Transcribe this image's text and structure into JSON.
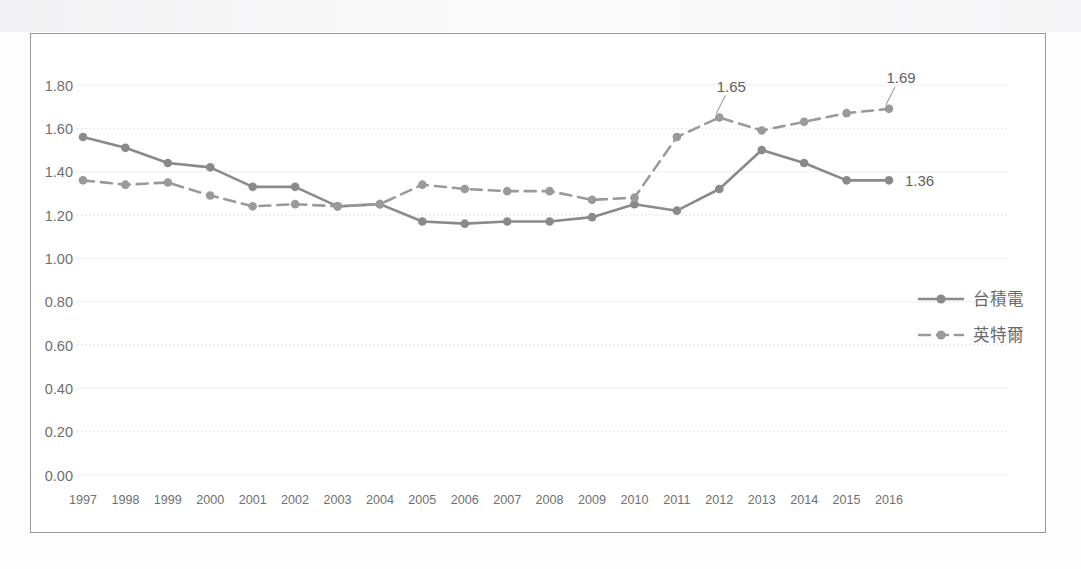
{
  "chart_data": {
    "type": "line",
    "title": "",
    "subtitle": "",
    "xlabel": "",
    "ylabel": "",
    "ylim": [
      0.0,
      1.8
    ],
    "ytick_step": 0.2,
    "ytick_labels": [
      "1.80",
      "1.60",
      "1.40",
      "1.20",
      "1.00",
      "0.80",
      "0.60",
      "0.40",
      "0.20",
      "0.00"
    ],
    "ytick_values": [
      1.8,
      1.6,
      1.4,
      1.2,
      1.0,
      0.8,
      0.6,
      0.4,
      0.2,
      0.0
    ],
    "grid": true,
    "grid_style": "horizontal-dotted",
    "legend_position": "right",
    "categories": [
      "1997",
      "1998",
      "1999",
      "2000",
      "2001",
      "2002",
      "2003",
      "2004",
      "2005",
      "2006",
      "2007",
      "2008",
      "2009",
      "2010",
      "2011",
      "2012",
      "2013",
      "2014",
      "2015",
      "2016"
    ],
    "series": [
      {
        "name": "台積電",
        "style": "solid",
        "color": "#8a8a8a",
        "marker": "circle",
        "values": [
          1.56,
          1.51,
          1.44,
          1.42,
          1.33,
          1.33,
          1.24,
          1.25,
          1.17,
          1.16,
          1.17,
          1.17,
          1.19,
          1.25,
          1.22,
          1.32,
          1.5,
          1.44,
          1.36,
          1.36
        ]
      },
      {
        "name": "英特爾",
        "style": "dashed",
        "color": "#9a9a9a",
        "marker": "circle",
        "values": [
          1.36,
          1.34,
          1.35,
          1.29,
          1.24,
          1.25,
          1.24,
          1.25,
          1.34,
          1.32,
          1.31,
          1.31,
          1.27,
          1.28,
          1.56,
          1.65,
          1.59,
          1.63,
          1.67,
          1.69
        ]
      }
    ],
    "annotations": [
      {
        "text": "1.65",
        "series": "英特爾",
        "category": "2012",
        "value": 1.65,
        "leader": true
      },
      {
        "text": "1.69",
        "series": "英特爾",
        "category": "2016",
        "value": 1.69,
        "leader": true
      },
      {
        "text": "1.36",
        "series": "台積電",
        "category": "2016",
        "value": 1.36,
        "leader": false
      }
    ]
  },
  "legend": {
    "entries": [
      {
        "label": "台積電",
        "style": "solid"
      },
      {
        "label": "英特爾",
        "style": "dashed"
      }
    ]
  },
  "colors": {
    "series_1": "#8a8a8a",
    "series_2": "#9a9a9a",
    "grid": "#e3e3e3",
    "frame": "#9a9a9a",
    "tick_text": "#6f6f6f"
  }
}
